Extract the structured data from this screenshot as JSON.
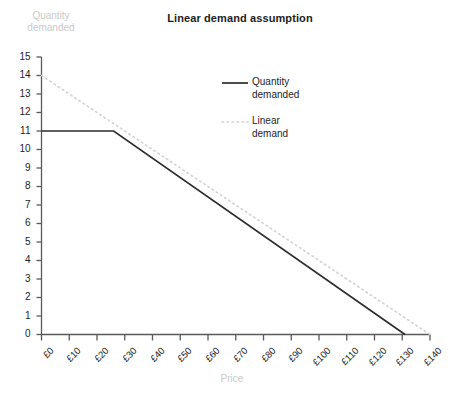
{
  "chart_data": {
    "type": "line",
    "title": "Linear demand assumption",
    "xlabel": "Price",
    "ylabel": "Quantity demanded",
    "xlim": [
      0,
      140
    ],
    "ylim": [
      0,
      15
    ],
    "grid": false,
    "legend_position": "upper-right",
    "x_tick_labels": [
      "£0",
      "£10",
      "£20",
      "£30",
      "£40",
      "£50",
      "£60",
      "£70",
      "£80",
      "£90",
      "£100",
      "£110",
      "£120",
      "£130",
      "£140"
    ],
    "x_tick_values": [
      0,
      10,
      20,
      30,
      40,
      50,
      60,
      70,
      80,
      90,
      100,
      110,
      120,
      130,
      140
    ],
    "y_tick_labels": [
      "15",
      "14",
      "13",
      "12",
      "11",
      "10",
      "9",
      "8",
      "7",
      "6",
      "5",
      "4",
      "3",
      "2",
      "1",
      "0"
    ],
    "y_tick_values": [
      15,
      14,
      13,
      12,
      11,
      10,
      9,
      8,
      7,
      6,
      5,
      4,
      3,
      2,
      1,
      0
    ],
    "series": [
      {
        "name": "Quantity demanded",
        "style": "solid",
        "color": "#2b2b2b",
        "points": [
          {
            "x": 0,
            "y": 11
          },
          {
            "x": 26,
            "y": 11
          },
          {
            "x": 131,
            "y": 0
          }
        ]
      },
      {
        "name": "Linear demand",
        "style": "dotted",
        "color": "#d2d2d2",
        "points": [
          {
            "x": 0,
            "y": 14
          },
          {
            "x": 140,
            "y": 0
          }
        ]
      }
    ],
    "legend": [
      {
        "label_line1": "Quantity",
        "label_line2": "demanded",
        "style": "solid",
        "color": "#2b2b2b"
      },
      {
        "label_line1": "Linear",
        "label_line2": "demand",
        "style": "dotted",
        "color": "#d2d2d2"
      }
    ]
  },
  "axis_color": "#5a5a5a",
  "title_color": "#1d1d1d",
  "axis_title_color": "#c9c9c9"
}
